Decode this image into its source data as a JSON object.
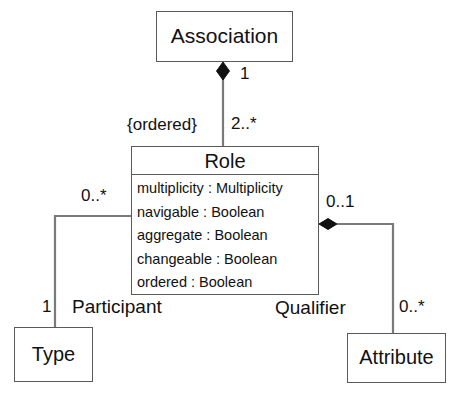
{
  "diagram": {
    "kind": "uml-class-diagram",
    "stroke_color": "#5a5a5a",
    "text_color": "#111111",
    "background": "#ffffff"
  },
  "classes": {
    "association": {
      "name": "Association",
      "attributes": []
    },
    "role": {
      "name": "Role",
      "attributes": [
        "multiplicity : Multiplicity",
        "navigable : Boolean",
        "aggregate : Boolean",
        "changeable : Boolean",
        "ordered : Boolean"
      ]
    },
    "type": {
      "name": "Type",
      "attributes": []
    },
    "attribute": {
      "name": "Attribute",
      "attributes": []
    }
  },
  "labels": {
    "association_end_multiplicity": "1",
    "role_end_multiplicity": "2..*",
    "ordered_constraint": "{ordered}",
    "participant_role_multiplicity": "0..*",
    "participant_role_name": "Participant",
    "type_end_multiplicity": "1",
    "qualifier_role_multiplicity": "0..1",
    "qualifier_role_name": "Qualifier",
    "attribute_end_multiplicity": "0..*"
  }
}
